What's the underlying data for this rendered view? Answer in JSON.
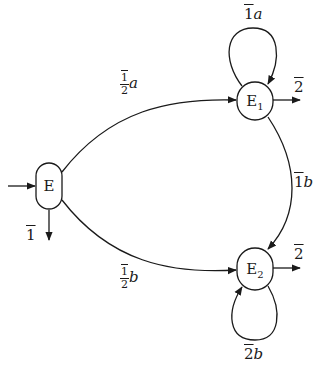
{
  "diagram": {
    "type": "state-transition",
    "nodes": [
      {
        "id": "E",
        "label": "E",
        "sub": "",
        "initial": true,
        "output": "1"
      },
      {
        "id": "E1",
        "label": "E",
        "sub": "1",
        "output": "2"
      },
      {
        "id": "E2",
        "label": "E",
        "sub": "2",
        "output": "2"
      }
    ],
    "edges": [
      {
        "from": "E",
        "to": "E1",
        "weight_num": "1",
        "weight_den": "2",
        "symbol": "a"
      },
      {
        "from": "E",
        "to": "E2",
        "weight_num": "1",
        "weight_den": "2",
        "symbol": "b"
      },
      {
        "from": "E1",
        "to": "E1",
        "weight": "1",
        "symbol": "a"
      },
      {
        "from": "E1",
        "to": "E2",
        "weight": "1",
        "symbol": "b"
      },
      {
        "from": "E2",
        "to": "E2",
        "weight": "2",
        "symbol": "b"
      }
    ],
    "colors": {
      "stroke": "#1a1a1a",
      "background": "#ffffff"
    }
  }
}
